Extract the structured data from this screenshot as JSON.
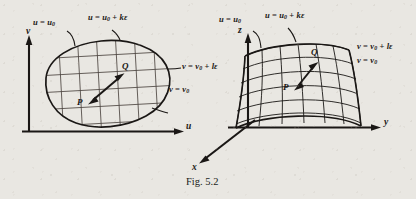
{
  "figure": {
    "caption": "Fig. 5.2",
    "panels": [
      {
        "id": "parameter-plane",
        "axes": {
          "vertical": "v",
          "horizontal": "u"
        },
        "region_labels": [
          {
            "id": "u-const-left",
            "text_html": "u = u₀"
          },
          {
            "id": "u-const-right",
            "text_html": "u = u₀ + kε"
          },
          {
            "id": "v-const-upper",
            "text_html": "v = v₀ + lε"
          },
          {
            "id": "v-const-lower",
            "text_html": "v = v₀"
          }
        ],
        "points": [
          {
            "id": "point-p",
            "label": "P"
          },
          {
            "id": "point-q",
            "label": "Q"
          }
        ]
      },
      {
        "id": "surface-patch",
        "axes": {
          "vertical": "z",
          "horizontal": "y",
          "depth": "x"
        },
        "region_labels": [
          {
            "id": "u-const-left",
            "text_html": "u = u₀"
          },
          {
            "id": "u-const-right",
            "text_html": "u = u₀ + kε"
          },
          {
            "id": "v-const-upper",
            "text_html": "v = v₀ + lε"
          },
          {
            "id": "v-const-lower",
            "text_html": "v = v₀"
          }
        ],
        "points": [
          {
            "id": "point-p",
            "label": "P"
          },
          {
            "id": "point-q",
            "label": "Q"
          }
        ]
      }
    ],
    "labels": {
      "left_u_const_left": "u = u₀",
      "left_u_const_right": "u = u₀ + kε",
      "left_v_const_upper": "v = v₀ + lε",
      "left_v_const_lower": "v = v₀",
      "left_axis_v": "v",
      "left_axis_u": "u",
      "left_point_p": "P",
      "left_point_q": "Q",
      "right_u_const_left": "u = u₀",
      "right_u_const_right": "u = u₀ + kε",
      "right_v_const_upper": "v = v₀ + lε",
      "right_v_const_lower": "v = v₀",
      "right_axis_z": "z",
      "right_axis_y": "y",
      "right_axis_x": "x",
      "right_point_p": "P",
      "right_point_q": "Q"
    },
    "colors": {
      "ink": "#1a1715",
      "grid": "#4b4540",
      "paper": "#e9e7e2"
    }
  }
}
